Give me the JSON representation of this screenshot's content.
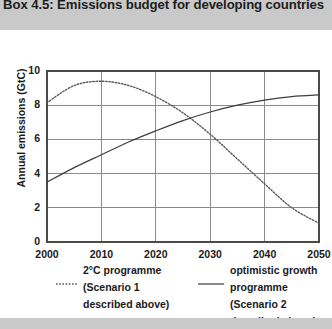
{
  "box": {
    "title": "Box 4.5: Emissions budget for developing countries"
  },
  "colors": {
    "band": "#c9c9c9",
    "card": "#ffffff",
    "axis": "#4a4a4a",
    "grid": "#8a8a8a",
    "series_solid": "#3d3d3d",
    "series_dotted": "#5a5a5a",
    "text": "#1a1a1a"
  },
  "chart_data": {
    "type": "line",
    "title": "",
    "xlabel": "",
    "ylabel": "Annual emissions (GtC)",
    "xlim": [
      2000,
      2050
    ],
    "ylim": [
      0,
      10
    ],
    "xticks": [
      "2000",
      "2010",
      "2020",
      "2030",
      "2040",
      "2050"
    ],
    "yticks": [
      "0",
      "2",
      "4",
      "6",
      "8",
      "10"
    ],
    "grid": "horizontal-and-vertical",
    "legend_position": "below",
    "x": [
      2000,
      2005,
      2010,
      2015,
      2020,
      2025,
      2030,
      2035,
      2040,
      2045,
      2050
    ],
    "series": [
      {
        "name": "2°C programme (Scenario 1 described above)",
        "style": "dotted",
        "legend_lines": [
          "2°C programme",
          "(Scenario 1",
          "described above)"
        ],
        "values": [
          8.15,
          9.15,
          9.4,
          9.15,
          8.5,
          7.55,
          6.3,
          4.85,
          3.4,
          2.0,
          1.1
        ]
      },
      {
        "name": "optimistic growth programme (Scenario 2 described above)",
        "style": "solid",
        "legend_lines": [
          "optimistic growth",
          "programme (Scenario 2",
          "described above)"
        ],
        "values": [
          3.5,
          4.35,
          5.1,
          5.85,
          6.5,
          7.1,
          7.6,
          8.0,
          8.3,
          8.5,
          8.6
        ]
      }
    ],
    "crossover": {
      "year": 2027,
      "value": 7.3
    }
  }
}
